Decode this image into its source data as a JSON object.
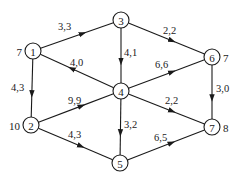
{
  "diagram": {
    "type": "directed-network-flow-graph",
    "nodes": [
      {
        "id": "1",
        "label": "1",
        "x": 33,
        "y": 51,
        "side_value": "7",
        "side": "left"
      },
      {
        "id": "2",
        "label": "2",
        "x": 31,
        "y": 125,
        "side_value": "10",
        "side": "left"
      },
      {
        "id": "3",
        "label": "3",
        "x": 121,
        "y": 20,
        "side_value": null,
        "side": null
      },
      {
        "id": "4",
        "label": "4",
        "x": 121,
        "y": 91,
        "side_value": null,
        "side": null
      },
      {
        "id": "5",
        "label": "5",
        "x": 120,
        "y": 163,
        "side_value": null,
        "side": null
      },
      {
        "id": "6",
        "label": "6",
        "x": 212,
        "y": 57,
        "side_value": "7",
        "side": "right"
      },
      {
        "id": "7",
        "label": "7",
        "x": 212,
        "y": 127,
        "side_value": "8",
        "side": "right"
      }
    ],
    "edges": [
      {
        "from": "1",
        "to": "3",
        "label": "3,3",
        "lx": 58,
        "ly": 30
      },
      {
        "from": "4",
        "to": "1",
        "label": "4,0",
        "lx": 70,
        "ly": 66
      },
      {
        "from": "1",
        "to": "2",
        "label": "4,3",
        "lx": 11,
        "ly": 91
      },
      {
        "from": "3",
        "to": "4",
        "label": "4,1",
        "lx": 124,
        "ly": 56
      },
      {
        "from": "3",
        "to": "6",
        "label": "2,2",
        "lx": 163,
        "ly": 34
      },
      {
        "from": "4",
        "to": "6",
        "label": "6,6",
        "lx": 155,
        "ly": 68
      },
      {
        "from": "2",
        "to": "4",
        "label": "9,9",
        "lx": 68,
        "ly": 104
      },
      {
        "from": "4",
        "to": "7",
        "label": "2,2",
        "lx": 165,
        "ly": 104
      },
      {
        "from": "4",
        "to": "5",
        "label": "3,2",
        "lx": 124,
        "ly": 128
      },
      {
        "from": "6",
        "to": "7",
        "label": "3,0",
        "lx": 216,
        "ly": 92
      },
      {
        "from": "2",
        "to": "5",
        "label": "4,3",
        "lx": 68,
        "ly": 138
      },
      {
        "from": "5",
        "to": "7",
        "label": "6,5",
        "lx": 154,
        "ly": 141
      }
    ],
    "node_radius": 8,
    "colors": {
      "stroke": "#1a1a1a",
      "background": "#ffffff",
      "node_fill": "#ffffff"
    }
  }
}
